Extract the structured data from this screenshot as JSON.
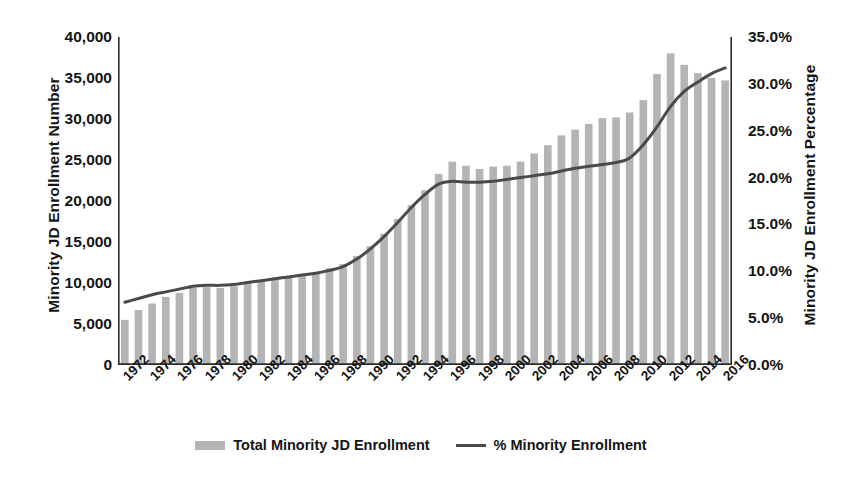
{
  "chart_data": {
    "type": "bar",
    "title": "",
    "xlabel": "",
    "ylabel": "Minority JD Enrollment Number",
    "y2label": "Minority JD Enrollment Percentage",
    "grid": false,
    "legend_position": "bottom",
    "ylim": [
      0,
      40000
    ],
    "y2lim": [
      0,
      35
    ],
    "y_ticks": [
      "0",
      "5,000",
      "10,000",
      "15,000",
      "20,000",
      "25,000",
      "30,000",
      "35,000",
      "40,000"
    ],
    "y2_ticks": [
      "0.0%",
      "5.0%",
      "10.0%",
      "15.0%",
      "20.0%",
      "25.0%",
      "30.0%",
      "35.0%"
    ],
    "x": [
      1972,
      1973,
      1974,
      1975,
      1976,
      1977,
      1978,
      1979,
      1980,
      1981,
      1982,
      1983,
      1984,
      1985,
      1986,
      1987,
      1988,
      1989,
      1990,
      1991,
      1992,
      1993,
      1994,
      1995,
      1996,
      1997,
      1998,
      1999,
      2000,
      2001,
      2002,
      2003,
      2004,
      2005,
      2006,
      2007,
      2008,
      2009,
      2010,
      2011,
      2012,
      2013,
      2014,
      2015,
      2016
    ],
    "x_tick_labels": [
      "1972",
      "1974",
      "1976",
      "1978",
      "1980",
      "1982",
      "1984",
      "1986",
      "1988",
      "1990",
      "1992",
      "1994",
      "1996",
      "1998",
      "2000",
      "2002",
      "2004",
      "2006",
      "2008",
      "2010",
      "2012",
      "2014",
      "2016"
    ],
    "series": [
      {
        "name": "Total Minority JD Enrollment",
        "type": "bar",
        "axis": "left",
        "color": "#b4b4b4",
        "values": [
          5500,
          6700,
          7500,
          8300,
          8800,
          9400,
          9500,
          9400,
          9600,
          10000,
          10300,
          10600,
          10700,
          11000,
          11200,
          11800,
          12300,
          13300,
          14500,
          16000,
          17800,
          19500,
          21300,
          23300,
          24800,
          24300,
          23900,
          24200,
          24300,
          24800,
          25800,
          26800,
          28000,
          28700,
          29400,
          30100,
          30200,
          30800,
          32300,
          35500,
          38000,
          36600,
          35600,
          35000,
          34700
        ]
      },
      {
        "name": "% Minority Enrollment",
        "type": "line",
        "axis": "right",
        "color": "#4a4a4a",
        "values": [
          6.7,
          7.1,
          7.5,
          7.8,
          8.1,
          8.4,
          8.5,
          8.5,
          8.6,
          8.8,
          9.0,
          9.2,
          9.4,
          9.6,
          9.8,
          10.1,
          10.5,
          11.3,
          12.4,
          13.7,
          15.2,
          16.8,
          18.2,
          19.3,
          19.6,
          19.5,
          19.5,
          19.6,
          19.8,
          20.0,
          20.2,
          20.4,
          20.7,
          21.0,
          21.2,
          21.4,
          21.6,
          22.1,
          23.5,
          25.4,
          27.6,
          29.2,
          30.2,
          31.1,
          31.7
        ]
      }
    ]
  }
}
